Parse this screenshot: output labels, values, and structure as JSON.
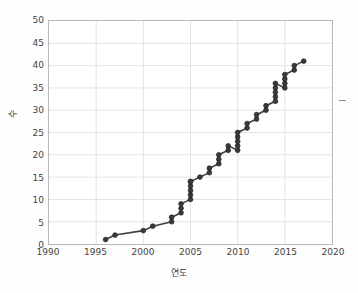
{
  "chart_data": {
    "type": "line",
    "title": "",
    "xlabel": "연도",
    "ylabel": "수",
    "xlim": [
      1990,
      2020
    ],
    "ylim": [
      0,
      50
    ],
    "xticks": [
      1990,
      1995,
      2000,
      2005,
      2010,
      2015,
      2020
    ],
    "yticks": [
      0,
      5,
      10,
      15,
      20,
      25,
      30,
      35,
      40,
      45,
      50
    ],
    "grid": true,
    "legend": null,
    "marker": "circle",
    "marker_color": "#3a3a3a",
    "line_color": "#3f3f3f",
    "series": [
      {
        "name": "누적 수",
        "x": [
          1996,
          1997,
          2000,
          2001,
          2003,
          2003,
          2004,
          2004,
          2004,
          2005,
          2005,
          2005,
          2005,
          2005,
          2005,
          2006,
          2007,
          2007,
          2008,
          2008,
          2008,
          2009,
          2009,
          2010,
          2010,
          2010,
          2010,
          2010,
          2011,
          2011,
          2012,
          2012,
          2013,
          2013,
          2014,
          2014,
          2014,
          2014,
          2014,
          2015,
          2015,
          2015,
          2015,
          2016,
          2016,
          2017
        ],
        "y": [
          1,
          2,
          3,
          4,
          5,
          6,
          7,
          8,
          9,
          10,
          11,
          12,
          13,
          14,
          14,
          15,
          16,
          17,
          18,
          19,
          20,
          21,
          22,
          21,
          22,
          23,
          24,
          25,
          26,
          27,
          28,
          29,
          30,
          31,
          32,
          33,
          34,
          35,
          36,
          35,
          36,
          37,
          38,
          39,
          40,
          41
        ]
      }
    ]
  },
  "axes": {
    "x_tick_labels": [
      "1990",
      "1995",
      "2000",
      "2005",
      "2010",
      "2015",
      "2020"
    ],
    "y_tick_labels": [
      "0",
      "5",
      "10",
      "15",
      "20",
      "25",
      "30",
      "35",
      "40",
      "45",
      "50"
    ],
    "x_title": "연도",
    "y_title": "수"
  }
}
